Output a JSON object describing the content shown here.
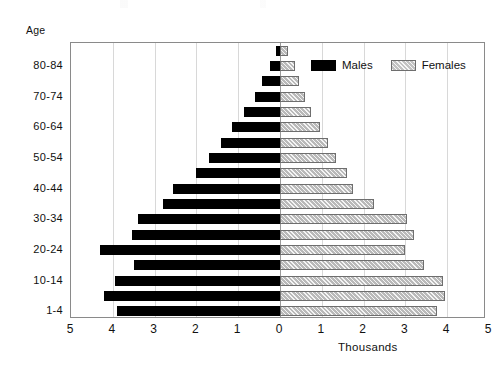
{
  "chart_data": {
    "type": "bar",
    "subtype": "population-pyramid",
    "title": "",
    "xlabel": "Thousands",
    "ylabel": "Age",
    "orientation": "horizontal",
    "grid": true,
    "legend_position": "inside-top-right",
    "xlim": [
      -5,
      5
    ],
    "xticks": [
      5,
      4,
      3,
      2,
      1,
      0,
      1,
      2,
      3,
      4,
      5
    ],
    "xtick_labels": [
      "5",
      "4",
      "3",
      "2",
      "1",
      "0",
      "1",
      "2",
      "3",
      "4",
      "5"
    ],
    "categories": [
      "1-4",
      "5-9",
      "10-14",
      "15-19",
      "20-24",
      "25-29",
      "30-34",
      "35-39",
      "40-44",
      "45-49",
      "50-54",
      "55-59",
      "60-64",
      "65-69",
      "70-74",
      "75-79",
      "80-84",
      "85+"
    ],
    "visible_category_labels": [
      "80-84",
      "70-74",
      "60-64",
      "50-54",
      "40-44",
      "30-34",
      "20-24",
      "10-14",
      "1-4"
    ],
    "series": [
      {
        "name": "Males",
        "color": "#000000",
        "side": "left",
        "values": [
          3.9,
          4.2,
          3.95,
          3.5,
          4.3,
          3.55,
          3.4,
          2.8,
          2.55,
          2.0,
          1.7,
          1.4,
          1.15,
          0.85,
          0.6,
          0.42,
          0.25,
          0.1
        ]
      },
      {
        "name": "Females",
        "color": "#b9b9b9",
        "side": "right",
        "values": [
          3.75,
          3.95,
          3.9,
          3.45,
          3.0,
          3.2,
          3.05,
          2.25,
          1.75,
          1.6,
          1.35,
          1.15,
          0.95,
          0.75,
          0.6,
          0.45,
          0.35,
          0.2
        ]
      }
    ]
  },
  "axes": {
    "y_axis_title": "Age",
    "x_axis_title": "Thousands"
  },
  "legend": {
    "entries": [
      {
        "label": "Males",
        "swatch": "solid-black-swatch"
      },
      {
        "label": "Females",
        "swatch": "hatched-gray-swatch"
      }
    ]
  }
}
